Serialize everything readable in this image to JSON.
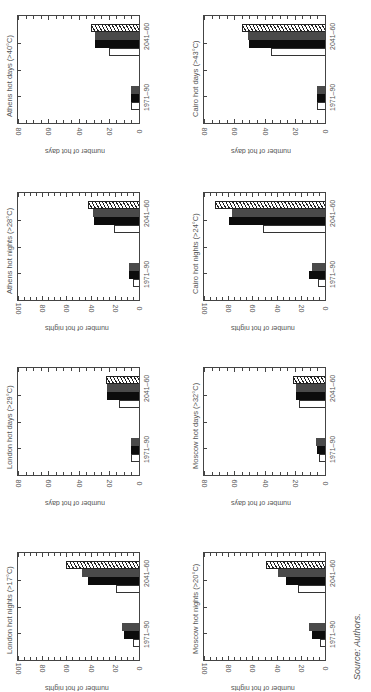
{
  "figure": {
    "orientation": "rotated-90",
    "source_note": "Source: Authors.",
    "periods": [
      "1971–90",
      "2041–60"
    ],
    "series_styles": [
      "white-outline",
      "black",
      "dark-gray",
      "hatched"
    ]
  },
  "panels": [
    {
      "title": "Athens hot days (>40°C)",
      "ylabel": "number of hot days",
      "ymax": 80,
      "ticks": [
        "80",
        "60",
        "40",
        "20",
        "0"
      ],
      "p1": [
        5,
        5,
        5
      ],
      "p2": [
        20,
        29,
        29,
        32
      ]
    },
    {
      "title": "Cairo hot days (>43°C)",
      "ylabel": "number of hot days",
      "ymax": 80,
      "ticks": [
        "80",
        "60",
        "40",
        "20",
        "0"
      ],
      "p1": [
        5,
        5,
        5
      ],
      "p2": [
        36,
        50,
        51,
        55
      ]
    },
    {
      "title": "Athens hot nights (>28°C)",
      "ylabel": "number of hot nights",
      "ymax": 100,
      "ticks": [
        "100",
        "80",
        "60",
        "40",
        "20",
        "0"
      ],
      "p1": [
        5,
        8,
        8
      ],
      "p2": [
        21,
        37,
        38,
        42
      ]
    },
    {
      "title": "Cairo hot nights (>24°C)",
      "ylabel": "number of hot nights",
      "ymax": 100,
      "ticks": [
        "100",
        "80",
        "60",
        "40",
        "20",
        "0"
      ],
      "p1": [
        6,
        13,
        11
      ],
      "p2": [
        51,
        79,
        77,
        91
      ]
    },
    {
      "title": "London hot days (>29°C)",
      "ylabel": "number of hot days",
      "ymax": 80,
      "ticks": [
        "80",
        "60",
        "40",
        "20",
        "0"
      ],
      "p1": [
        5,
        5,
        5
      ],
      "p2": [
        13,
        21,
        21,
        22
      ]
    },
    {
      "title": "Moscow hot days (>32°C)",
      "ylabel": "number of hot days",
      "ymax": 80,
      "ticks": [
        "80",
        "60",
        "40",
        "20",
        "0"
      ],
      "p1": [
        4,
        5,
        6
      ],
      "p2": [
        17,
        19,
        19,
        21
      ]
    },
    {
      "title": "London hot nights (>17°C)",
      "ylabel": "number of hot nights",
      "ymax": 100,
      "ticks": [
        "100",
        "80",
        "60",
        "40",
        "20",
        "0"
      ],
      "p1": [
        5,
        12,
        14
      ],
      "p2": [
        19,
        42,
        47,
        60
      ]
    },
    {
      "title": "Moscow hot nights (>20°C)",
      "ylabel": "number of hot nights",
      "ymax": 100,
      "ticks": [
        "100",
        "80",
        "60",
        "40",
        "20",
        "0"
      ],
      "p1": [
        4,
        11,
        13
      ],
      "p2": [
        22,
        32,
        39,
        49
      ]
    }
  ],
  "chart_data": [
    {
      "type": "bar",
      "title": "Athens hot days (>40°C)",
      "ylabel": "number of hot days",
      "ylim": [
        0,
        80
      ],
      "categories": [
        "1971–90",
        "2041–60"
      ],
      "series": [
        {
          "name": "white",
          "values": [
            5,
            20
          ]
        },
        {
          "name": "black",
          "values": [
            5,
            29
          ]
        },
        {
          "name": "dark gray",
          "values": [
            5,
            29
          ]
        },
        {
          "name": "hatched",
          "values": [
            null,
            32
          ]
        }
      ]
    },
    {
      "type": "bar",
      "title": "Cairo hot days (>43°C)",
      "ylabel": "number of hot days",
      "ylim": [
        0,
        80
      ],
      "categories": [
        "1971–90",
        "2041–60"
      ],
      "series": [
        {
          "name": "white",
          "values": [
            5,
            36
          ]
        },
        {
          "name": "black",
          "values": [
            5,
            50
          ]
        },
        {
          "name": "dark gray",
          "values": [
            5,
            51
          ]
        },
        {
          "name": "hatched",
          "values": [
            null,
            55
          ]
        }
      ]
    },
    {
      "type": "bar",
      "title": "Athens hot nights (>28°C)",
      "ylabel": "number of hot nights",
      "ylim": [
        0,
        100
      ],
      "categories": [
        "1971–90",
        "2041–60"
      ],
      "series": [
        {
          "name": "white",
          "values": [
            5,
            21
          ]
        },
        {
          "name": "black",
          "values": [
            8,
            37
          ]
        },
        {
          "name": "dark gray",
          "values": [
            8,
            38
          ]
        },
        {
          "name": "hatched",
          "values": [
            null,
            42
          ]
        }
      ]
    },
    {
      "type": "bar",
      "title": "Cairo hot nights (>24°C)",
      "ylabel": "number of hot nights",
      "ylim": [
        0,
        100
      ],
      "categories": [
        "1971–90",
        "2041–60"
      ],
      "series": [
        {
          "name": "white",
          "values": [
            6,
            51
          ]
        },
        {
          "name": "black",
          "values": [
            13,
            79
          ]
        },
        {
          "name": "dark gray",
          "values": [
            11,
            77
          ]
        },
        {
          "name": "hatched",
          "values": [
            null,
            91
          ]
        }
      ]
    },
    {
      "type": "bar",
      "title": "London hot days (>29°C)",
      "ylabel": "number of hot days",
      "ylim": [
        0,
        80
      ],
      "categories": [
        "1971–90",
        "2041–60"
      ],
      "series": [
        {
          "name": "white",
          "values": [
            5,
            13
          ]
        },
        {
          "name": "black",
          "values": [
            5,
            21
          ]
        },
        {
          "name": "dark gray",
          "values": [
            5,
            21
          ]
        },
        {
          "name": "hatched",
          "values": [
            null,
            22
          ]
        }
      ]
    },
    {
      "type": "bar",
      "title": "Moscow hot days (>32°C)",
      "ylabel": "number of hot days",
      "ylim": [
        0,
        80
      ],
      "categories": [
        "1971–90",
        "2041–60"
      ],
      "series": [
        {
          "name": "white",
          "values": [
            4,
            17
          ]
        },
        {
          "name": "black",
          "values": [
            5,
            19
          ]
        },
        {
          "name": "dark gray",
          "values": [
            6,
            19
          ]
        },
        {
          "name": "hatched",
          "values": [
            null,
            21
          ]
        }
      ]
    },
    {
      "type": "bar",
      "title": "London hot nights (>17°C)",
      "ylabel": "number of hot nights",
      "ylim": [
        0,
        100
      ],
      "categories": [
        "1971–90",
        "2041–60"
      ],
      "series": [
        {
          "name": "white",
          "values": [
            5,
            19
          ]
        },
        {
          "name": "black",
          "values": [
            12,
            42
          ]
        },
        {
          "name": "dark gray",
          "values": [
            14,
            47
          ]
        },
        {
          "name": "hatched",
          "values": [
            null,
            60
          ]
        }
      ]
    },
    {
      "type": "bar",
      "title": "Moscow hot nights (>20°C)",
      "ylabel": "number of hot nights",
      "ylim": [
        0,
        100
      ],
      "categories": [
        "1971–90",
        "2041–60"
      ],
      "series": [
        {
          "name": "white",
          "values": [
            4,
            22
          ]
        },
        {
          "name": "black",
          "values": [
            11,
            32
          ]
        },
        {
          "name": "dark gray",
          "values": [
            13,
            39
          ]
        },
        {
          "name": "hatched",
          "values": [
            null,
            49
          ]
        }
      ]
    }
  ]
}
